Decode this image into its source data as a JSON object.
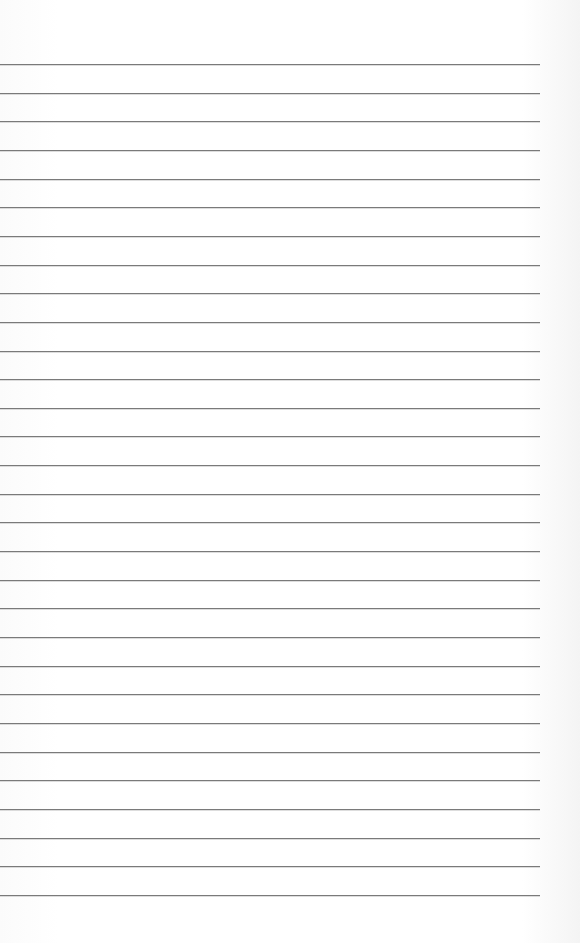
{
  "page": {
    "type": "blank lined paper",
    "line_count": 30,
    "line_color": "#7a7a7a",
    "background_color": "#fdfdfd",
    "first_line_y": 64,
    "line_spacing": 28.65
  }
}
